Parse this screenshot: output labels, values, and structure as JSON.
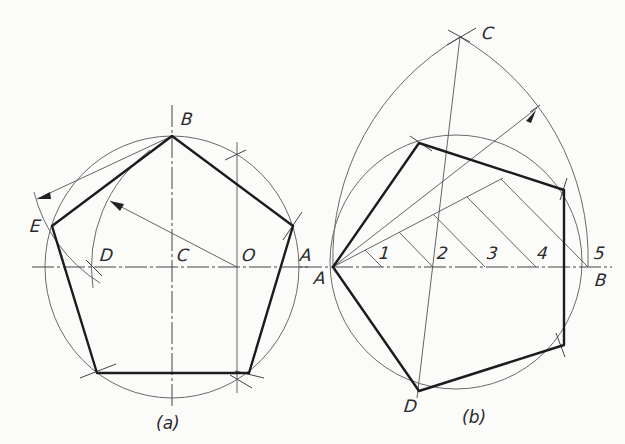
{
  "figure_a": {
    "caption": "(a)",
    "labels": {
      "B": "B",
      "E": "E",
      "D": "D",
      "C": "C",
      "O": "O",
      "A": "A"
    }
  },
  "figure_b": {
    "caption": "(b)",
    "labels": {
      "C": "C",
      "A_left": "A",
      "A_lower": "A",
      "B": "B",
      "D": "D",
      "n1": "1",
      "n2": "2",
      "n3": "3",
      "n4": "4",
      "n5": "5"
    }
  },
  "colors": {
    "ink": "#1c1c1c",
    "construction": "#666666",
    "paper": "#fbfbfa"
  }
}
